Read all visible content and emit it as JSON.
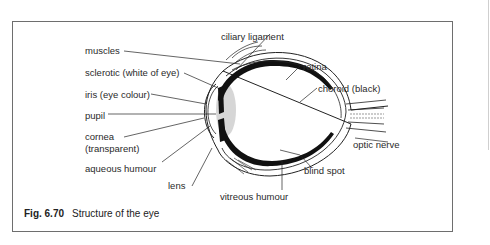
{
  "figure": {
    "number": "Fig. 6.70",
    "title": "Structure of the eye"
  },
  "labels": {
    "muscles": "muscles",
    "sclerotic": "sclerotic (white of eye)",
    "iris": "iris (eye colour)",
    "pupil": "pupil",
    "cornea": "cornea",
    "cornea_note": "(transparent)",
    "aqueous": "aqueous humour",
    "lens": "lens",
    "ciliary": "ciliary ligament",
    "retina": "retina",
    "choroid": "choroid (black)",
    "optic_nerve": "optic nerve",
    "blind_spot": "blind spot",
    "vitreous": "vitreous humour"
  }
}
